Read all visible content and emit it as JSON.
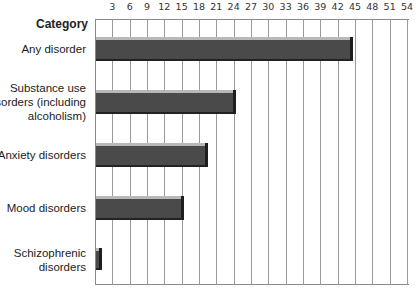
{
  "chart_data": {
    "type": "bar",
    "orientation": "horizontal",
    "title": "",
    "category_header": "Category",
    "xlabel": "",
    "ylabel": "Category",
    "xlim": [
      0,
      54
    ],
    "x_ticks": [
      3,
      6,
      9,
      12,
      15,
      18,
      21,
      24,
      27,
      30,
      33,
      36,
      39,
      42,
      45,
      48,
      51,
      54
    ],
    "grid": true,
    "legend": null,
    "categories": [
      "Any disorder",
      "Substance use disorders (including alcoholism)",
      "Anxiety disorders",
      "Mood disorders",
      "Schizophrenic disorders"
    ],
    "category_lines": [
      [
        "Any disorder"
      ],
      [
        "Substance use",
        "disorders (including",
        "alcoholism)"
      ],
      [
        "Anxiety disorders"
      ],
      [
        "Mood disorders"
      ],
      [
        "Schizophrenic",
        "disorders"
      ]
    ],
    "values": [
      44.5,
      24.2,
      19.4,
      15.2,
      1.1
    ],
    "colors": {
      "bar_body": "#4a4a4a",
      "bar_top": "#b8b8b8",
      "bar_edge": "#1e1e1e",
      "grid": "#9a9a9a"
    }
  }
}
